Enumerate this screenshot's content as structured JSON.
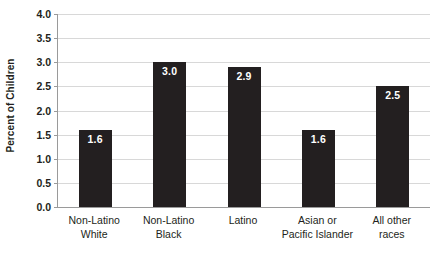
{
  "chart_data": {
    "type": "bar",
    "title": "",
    "subtitle": "",
    "xlabel": "",
    "ylabel": "Percent of Children",
    "ylim": [
      0,
      4.0
    ],
    "ytick_labels": [
      "4.0",
      "3.5",
      "3.0",
      "2.5",
      "2.0",
      "1.5",
      "1.0",
      "0.5",
      "0.0"
    ],
    "ytick_values": [
      4.0,
      3.5,
      3.0,
      2.5,
      2.0,
      1.5,
      1.0,
      0.5,
      0.0
    ],
    "grid": "horizontal",
    "legend": "none",
    "bar_color": "#231f20",
    "gridline_color": "#d8d8d8",
    "axis_color": "#9a9a9a",
    "value_label_color": "#ffffff",
    "categories": [
      "Non-Latino White",
      "Non-Latino Black",
      "Latino",
      "Asian or Pacific Islander",
      "All other races"
    ],
    "category_lines": [
      [
        "Non-Latino",
        "White"
      ],
      [
        "Non-Latino",
        "Black"
      ],
      [
        "Latino",
        ""
      ],
      [
        "Asian or",
        "Pacific Islander"
      ],
      [
        "All other",
        "races"
      ]
    ],
    "values": [
      1.6,
      3.0,
      2.9,
      1.6,
      2.5
    ],
    "value_labels": [
      "1.6",
      "3.0",
      "2.9",
      "1.6",
      "2.5"
    ]
  }
}
